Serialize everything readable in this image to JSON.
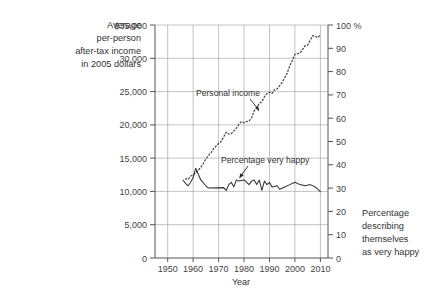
{
  "chart_data": {
    "type": "line",
    "title": "",
    "xlabel": "Year",
    "xlim": [
      1945,
      2013
    ],
    "x_ticks": [
      1950,
      1960,
      1970,
      1980,
      1990,
      2000,
      2010
    ],
    "grid": true,
    "legend": "none",
    "left_axis": {
      "label_lines": [
        "Average",
        "per-person",
        "after-tax income",
        "in 2005 dollars"
      ],
      "ylim": [
        0,
        35000
      ],
      "ticks": [
        0,
        5000,
        10000,
        15000,
        20000,
        25000,
        30000,
        35000
      ],
      "tick_labels": [
        "0",
        "5,000",
        "10,000",
        "15,000",
        "20,000",
        "25,000",
        "30,000",
        "$35,000"
      ]
    },
    "right_axis": {
      "label_lines": [
        "Percentage",
        "describing",
        "themselves",
        "as very happy"
      ],
      "ylim": [
        0,
        100
      ],
      "ticks": [
        0,
        10,
        20,
        30,
        40,
        50,
        60,
        70,
        80,
        90,
        100
      ],
      "tick_labels": [
        "0",
        "10",
        "20",
        "30",
        "40",
        "50",
        "60",
        "70",
        "80",
        "90",
        "100 %"
      ]
    },
    "series": [
      {
        "name": "Personal income",
        "axis": "left",
        "style": "dotted",
        "color": "#444444",
        "x": [
          1957,
          1958,
          1959,
          1960,
          1961,
          1962,
          1963,
          1964,
          1965,
          1966,
          1967,
          1968,
          1969,
          1970,
          1971,
          1972,
          1973,
          1974,
          1975,
          1976,
          1977,
          1978,
          1979,
          1980,
          1981,
          1982,
          1983,
          1984,
          1985,
          1986,
          1987,
          1988,
          1989,
          1990,
          1991,
          1992,
          1993,
          1994,
          1995,
          1996,
          1997,
          1998,
          1999,
          2000,
          2001,
          2002,
          2003,
          2004,
          2005,
          2006,
          2007,
          2008,
          2009,
          2010
        ],
        "y": [
          11900,
          11800,
          12300,
          12500,
          12800,
          13200,
          13600,
          14200,
          14900,
          15400,
          15800,
          16400,
          16800,
          17200,
          17500,
          18200,
          18900,
          18600,
          18700,
          19100,
          19500,
          20100,
          20500,
          20300,
          20500,
          20600,
          21100,
          22100,
          22600,
          23200,
          23500,
          24200,
          24700,
          24900,
          24700,
          25300,
          25400,
          25900,
          26400,
          27100,
          27800,
          28900,
          29700,
          30600,
          30700,
          30800,
          31300,
          31900,
          32000,
          32700,
          33400,
          33300,
          33100,
          33500
        ]
      },
      {
        "name": "Percentage very happy",
        "axis": "right",
        "style": "solid",
        "color": "#333333",
        "x": [
          1956,
          1957,
          1958,
          1959,
          1960,
          1961,
          1963,
          1965,
          1966,
          1972,
          1973,
          1974,
          1975,
          1976,
          1977,
          1978,
          1980,
          1982,
          1983,
          1984,
          1985,
          1986,
          1987,
          1988,
          1989,
          1990,
          1991,
          1993,
          1994,
          1996,
          1998,
          2000,
          2002,
          2004,
          2006,
          2008,
          2010
        ],
        "y": [
          33.5,
          32.0,
          31.0,
          32.5,
          34.5,
          38.5,
          33.5,
          31.0,
          30.0,
          30.2,
          29.0,
          31.5,
          32.5,
          30.5,
          33.5,
          33.0,
          33.5,
          31.5,
          33.0,
          33.5,
          31.5,
          33.5,
          29.0,
          33.0,
          31.5,
          32.5,
          30.5,
          31.0,
          29.5,
          30.5,
          31.5,
          32.5,
          31.5,
          31.0,
          31.5,
          30.5,
          28.5
        ]
      }
    ],
    "annotations": [
      {
        "text": "Personal income",
        "x": 1977,
        "y_left": 23500
      },
      {
        "text": "Percentage very happy",
        "x": 1990,
        "y_left": 14600
      }
    ]
  }
}
